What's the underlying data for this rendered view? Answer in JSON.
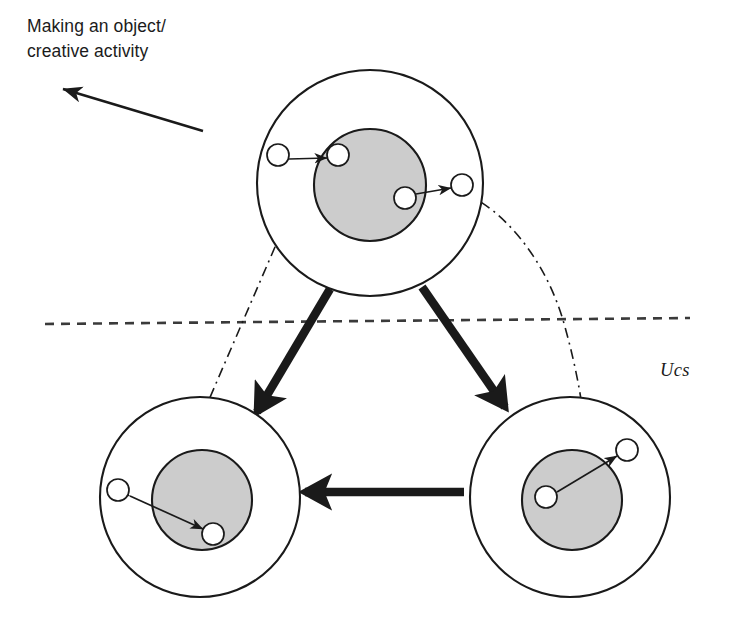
{
  "figure": {
    "title_caption": "Making an object/\ncreative activity",
    "region_label": "Ucs",
    "background_color": "#ffffff",
    "stroke_color": "#1a1a1a",
    "inner_disc_fill": "#cccccc",
    "small_circle_fill": "#ffffff",
    "thin_stroke_width": 1.7,
    "thick_stroke_width": 8.5,
    "outer_circle_stroke_width": 2.1,
    "dash_line_pattern": "9 7",
    "dashdot_line_pattern": "10 5 2 5"
  },
  "boundary_line": {
    "name": "unconscious-boundary",
    "x1": 45,
    "y1": 324,
    "x2": 690,
    "y2": 318,
    "style": "dashed"
  },
  "pointer_arrow": {
    "name": "creative-activity-arrow",
    "from_x": 203,
    "from_y": 131,
    "to_x": 63,
    "to_y": 89,
    "style": "solid-thin-arrow"
  },
  "units": [
    {
      "id": "top",
      "label": "top-unit",
      "outer": {
        "cx": 370,
        "cy": 183,
        "r": 113
      },
      "inner": {
        "cx": 370,
        "cy": 185,
        "r": 56
      },
      "small_circles": [
        {
          "id": "top-left-outer-node",
          "cx": 278,
          "cy": 155,
          "r": 11
        },
        {
          "id": "top-left-inner-node",
          "cx": 338,
          "cy": 155,
          "r": 11
        },
        {
          "id": "top-right-inner-node",
          "cx": 405,
          "cy": 198,
          "r": 11
        },
        {
          "id": "top-right-outer-node",
          "cx": 462,
          "cy": 185,
          "r": 11
        }
      ],
      "relations": [
        {
          "id": "top-left-relation",
          "x1": 289,
          "y1": 159,
          "x2": 327,
          "y2": 158
        },
        {
          "id": "top-right-relation",
          "x1": 416,
          "y1": 194,
          "x2": 451,
          "y2": 188
        }
      ]
    },
    {
      "id": "bottom-left",
      "label": "bottom-left-unit",
      "outer": {
        "cx": 200,
        "cy": 497,
        "r": 100
      },
      "inner": {
        "cx": 202,
        "cy": 500,
        "r": 50
      },
      "small_circles": [
        {
          "id": "bl-outer-node",
          "cx": 118,
          "cy": 490,
          "r": 11
        },
        {
          "id": "bl-inner-node",
          "cx": 213,
          "cy": 534,
          "r": 11
        }
      ],
      "relations": [
        {
          "id": "bl-relation",
          "x1": 130,
          "y1": 496,
          "x2": 203,
          "y2": 529
        }
      ]
    },
    {
      "id": "bottom-right",
      "label": "bottom-right-unit",
      "outer": {
        "cx": 570,
        "cy": 497,
        "r": 100
      },
      "inner": {
        "cx": 572,
        "cy": 500,
        "r": 50
      },
      "small_circles": [
        {
          "id": "br-inner-node",
          "cx": 546,
          "cy": 497,
          "r": 11
        },
        {
          "id": "br-outer-node",
          "cx": 627,
          "cy": 450,
          "r": 11
        }
      ],
      "relations": [
        {
          "id": "br-relation",
          "x1": 557,
          "y1": 492,
          "x2": 617,
          "y2": 456
        }
      ]
    }
  ],
  "cycle_arrows": [
    {
      "id": "top-to-bottom-left",
      "x1": 330,
      "y1": 289,
      "x2": 257,
      "y2": 412
    },
    {
      "id": "top-to-bottom-right",
      "x1": 422,
      "y1": 287,
      "x2": 505,
      "y2": 407
    },
    {
      "id": "bottom-right-to-bottom-left",
      "x1": 464,
      "y1": 492,
      "x2": 305,
      "y2": 492
    }
  ],
  "trajectories": [
    {
      "id": "left-trajectory",
      "type": "straight",
      "points": "310,166 160,513"
    },
    {
      "id": "right-trajectory",
      "type": "curved",
      "path": "M 462 192 C 505 210, 545 260, 563 320 C 578 372, 586 420, 587 462"
    }
  ]
}
